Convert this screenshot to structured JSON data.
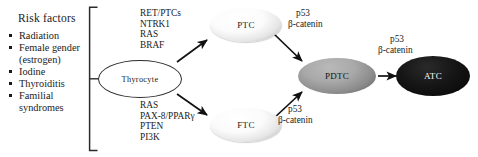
{
  "risk_panel": {
    "title": "Risk factors",
    "items": [
      {
        "label": "Radiation"
      },
      {
        "label": "Female gender",
        "continuation": "(estrogen)"
      },
      {
        "label": "Iodine"
      },
      {
        "label": "Thyroiditis"
      },
      {
        "label": "Familial",
        "continuation": "syndromes"
      }
    ]
  },
  "gene_lists": {
    "ptc_pathway": [
      "RET/PTCs",
      "NTRK1",
      "RAS",
      "BRAF"
    ],
    "ftc_pathway": [
      "RAS",
      "PAX-8/PPARγ",
      "PTEN",
      "PI3K"
    ]
  },
  "nodes": {
    "thyrocyte": "Thyrocyte",
    "ptc": "PTC",
    "ftc": "FTC",
    "pdtc": "PDTC",
    "atc": "ATC"
  },
  "edge_labels": {
    "ptc_to_pdtc_p53": "p53",
    "ptc_to_pdtc_bcatenin": "β-catenin",
    "ftc_to_pdtc_p53": "p53",
    "ftc_to_pdtc_bcatenin": "β-catenin",
    "pdtc_to_atc_p53": "p53",
    "pdtc_to_atc_bcatenin": "β-catenin"
  },
  "colors": {
    "background": "#ffffff",
    "text": "#1a1a1a",
    "stroke": "#2b2b2b",
    "pdtc_fill": "#8e8e8e",
    "atc_fill": "#050505"
  }
}
